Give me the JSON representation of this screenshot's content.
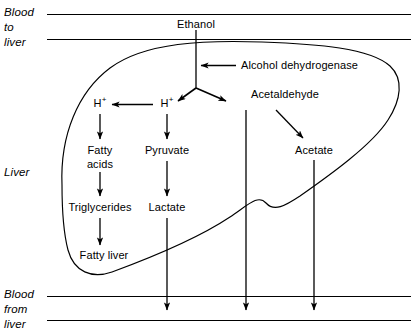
{
  "diagram": {
    "stroke_color": "#000000",
    "background_color": "#ffffff",
    "vessel_labels": {
      "top": {
        "line1": "Blood",
        "line2": "to",
        "line3": "liver"
      },
      "bottom": {
        "line1": "Blood",
        "line2": "from",
        "line3": "liver"
      }
    },
    "organ_label": "Liver",
    "nodes": {
      "ethanol": "Ethanol",
      "enzyme": "Alcohol dehydrogenase",
      "proton_right": "H",
      "proton_right_charge": "+",
      "proton_left": "H",
      "proton_left_charge": "+",
      "acetaldehyde": "Acetaldehyde",
      "fatty_acids_line1": "Fatty",
      "fatty_acids_line2": "acids",
      "pyruvate": "Pyruvate",
      "acetate": "Acetate",
      "triglycerides": "Triglycerides",
      "lactate": "Lactate",
      "fatty_liver": "Fatty liver"
    }
  }
}
